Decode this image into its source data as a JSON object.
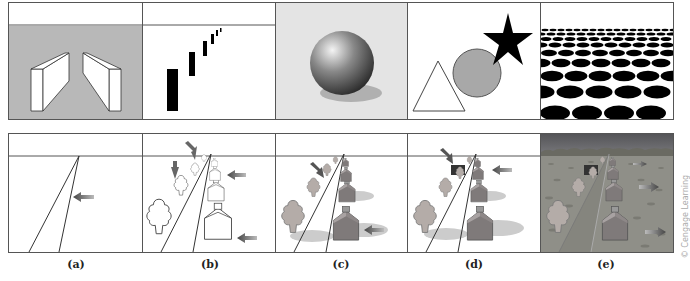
{
  "figure": {
    "top_row": [
      {
        "id": "a",
        "depicts": "two slanted walls on gray background"
      },
      {
        "id": "b",
        "depicts": "black bars decreasing in size toward upper right"
      },
      {
        "id": "c",
        "depicts": "shaded sphere with cast shadow"
      },
      {
        "id": "d",
        "depicts": "triangle, circle and star overlapping"
      },
      {
        "id": "e",
        "depicts": "texture gradient of black ellipses"
      }
    ],
    "bottom_row": [
      {
        "id": "a",
        "depicts": "converging road lines with arrow"
      },
      {
        "id": "b",
        "depicts": "outline trees and houses with arrows"
      },
      {
        "id": "c",
        "depicts": "shaded trees and houses with shadows"
      },
      {
        "id": "d",
        "depicts": "occlusion scene with trees and houses"
      },
      {
        "id": "e",
        "depicts": "full scene with textured ground and sky"
      }
    ],
    "captions": [
      "(a)",
      "(b)",
      "(c)",
      "(d)",
      "(e)"
    ],
    "credit": "© Cengage Learning"
  },
  "colors": {
    "gray_bg": "#b8b8b8",
    "sphere_bg": "#e4e4e4",
    "circle": "#a8a8a8",
    "arrow": "#6a6a6a",
    "ground": "#8f8f88",
    "sky": "#5e5e60"
  }
}
